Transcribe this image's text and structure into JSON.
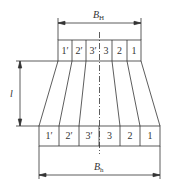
{
  "top_dimension": {
    "label": "B",
    "subscript": "H"
  },
  "bottom_dimension": {
    "label": "B",
    "subscript": "h"
  },
  "height_dimension": {
    "label": "l"
  },
  "top_cells": [
    "1′",
    "2′",
    "3′",
    "3",
    "2",
    "1"
  ],
  "bottom_cells": [
    "1′",
    "2′",
    "3′",
    "3",
    "2",
    "1"
  ],
  "colors": {
    "line": "#333333",
    "background": "#ffffff"
  }
}
